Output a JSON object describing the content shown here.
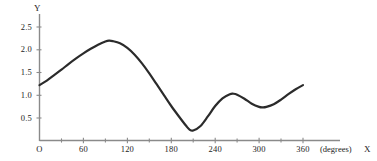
{
  "chart_data": {
    "type": "line",
    "title": "",
    "xlabel": "X",
    "ylabel": "Y",
    "x_units": "(degrees)",
    "xlim": [
      0,
      360
    ],
    "ylim": [
      0,
      2.75
    ],
    "grid": false,
    "legend": null,
    "x_tick_labels": [
      "O",
      "60",
      "120",
      "180",
      "240",
      "300",
      "360"
    ],
    "x_tick_values": [
      0,
      60,
      120,
      180,
      240,
      300,
      360
    ],
    "x_minor_tick_values": [
      30,
      90,
      150,
      210,
      270,
      330
    ],
    "y_tick_labels": [
      "0.5",
      "1.0",
      "1.5",
      "2.0",
      "2.5"
    ],
    "y_tick_values": [
      0.5,
      1.0,
      1.5,
      2.0,
      2.5
    ],
    "series": [
      {
        "name": "curve",
        "color": "#2b2b2b",
        "x": [
          0,
          10,
          20,
          30,
          40,
          50,
          60,
          70,
          80,
          90,
          95,
          100,
          110,
          120,
          130,
          140,
          150,
          160,
          170,
          180,
          190,
          200,
          205,
          210,
          220,
          230,
          240,
          250,
          260,
          265,
          270,
          280,
          290,
          300,
          305,
          310,
          320,
          330,
          340,
          350,
          360
        ],
        "y": [
          1.22,
          1.32,
          1.44,
          1.56,
          1.69,
          1.81,
          1.92,
          2.02,
          2.11,
          2.18,
          2.2,
          2.19,
          2.14,
          2.04,
          1.89,
          1.7,
          1.48,
          1.24,
          1.0,
          0.76,
          0.54,
          0.33,
          0.24,
          0.22,
          0.32,
          0.53,
          0.76,
          0.93,
          1.02,
          1.03,
          1.01,
          0.92,
          0.81,
          0.74,
          0.73,
          0.74,
          0.8,
          0.9,
          1.02,
          1.13,
          1.22
        ]
      }
    ],
    "annotations": {
      "peak_x": 95,
      "peak_y": 2.2,
      "trough_x": 207,
      "trough_y": 0.22,
      "local_max_x": 265,
      "local_max_y": 1.03,
      "local_min_x": 303,
      "local_min_y": 0.73,
      "start_y": 1.22,
      "end_y": 1.22
    },
    "colors": {
      "curve": "#2b2b2b",
      "axis": "#8a8a8a",
      "text": "#1c1c1c",
      "background": "#ffffff"
    }
  }
}
